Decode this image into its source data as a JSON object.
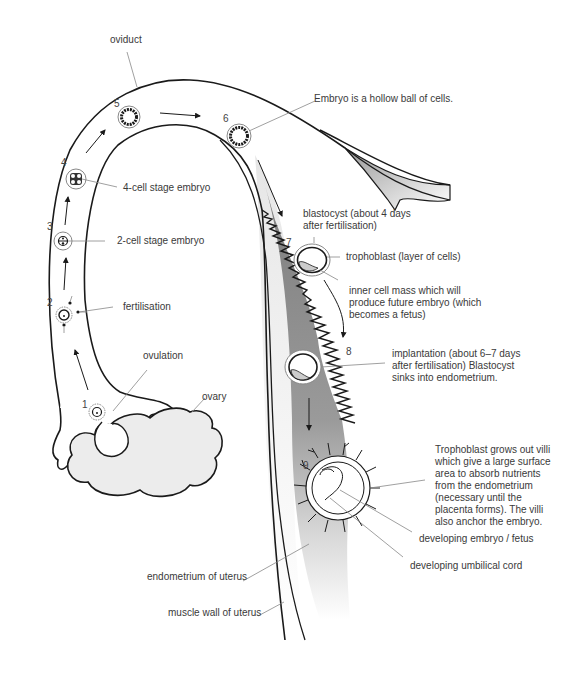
{
  "stages": [
    {
      "number": "1",
      "label": "ovulation"
    },
    {
      "number": "2",
      "label": "fertilisation"
    },
    {
      "number": "3",
      "label": "2-cell stage embryo"
    },
    {
      "number": "4",
      "label": "4-cell stage embryo"
    },
    {
      "number": "5",
      "label": ""
    },
    {
      "number": "6",
      "label": "Embryo is a hollow ball of cells."
    },
    {
      "number": "7",
      "label": "blastocyst (about 4 days after fertilisation)"
    },
    {
      "number": "8",
      "label": "implantation (about 6–7 days after fertilisation) Blastocyst sinks into endometrium."
    },
    {
      "number": "9",
      "label": "Trophoblast grows out villi which give a large surface area to absorb nutrients from the endometrium (necessary until the placenta forms). The villi also anchor the embryo."
    }
  ],
  "labels": {
    "oviduct": "oviduct",
    "ovary": "ovary",
    "trophoblast": "trophoblast (layer of cells)",
    "inner_cell_mass": "inner cell mass which will produce future embryo (which becomes a fetus)",
    "developing_embryo": "developing embryo / fetus",
    "umbilical_cord": "developing umbilical cord",
    "endometrium": "endometrium of uterus",
    "muscle_wall": "muscle wall of uterus"
  },
  "colors": {
    "line": "#1a1a1a",
    "leader": "#888888",
    "ovary_fill": "#ececec",
    "endometrium_dark": "#8a8a8a",
    "endometrium_light": "#f2f2f2",
    "text": "#3a3a3a"
  }
}
